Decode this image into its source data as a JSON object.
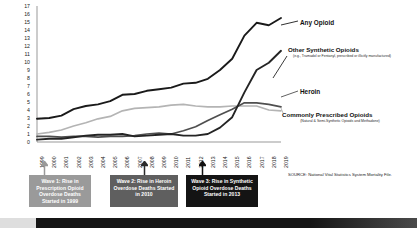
{
  "chart_data": {
    "type": "line",
    "title": "",
    "xlabel": "",
    "ylabel": "Deaths per 100,000 population",
    "ylim": [
      0,
      17
    ],
    "xlim": [
      1999,
      2019
    ],
    "grid": false,
    "legend_position": "inline-right",
    "x": [
      1999,
      2000,
      2001,
      2002,
      2003,
      2004,
      2005,
      2006,
      2007,
      2008,
      2009,
      2010,
      2011,
      2012,
      2013,
      2014,
      2015,
      2016,
      2017,
      2018,
      2019
    ],
    "y_ticks": [
      17,
      16,
      15,
      14,
      13,
      12,
      11,
      10,
      9,
      8,
      7,
      6,
      5,
      4,
      3,
      2,
      1,
      0
    ],
    "x_ticks": [
      "1999",
      "2000",
      "2001",
      "2002",
      "2003",
      "2004",
      "2005",
      "2006",
      "2007",
      "2008",
      "2009",
      "2010",
      "2011",
      "2012",
      "2013",
      "2014",
      "2015",
      "2016",
      "2017",
      "2018",
      "2019"
    ],
    "series": [
      {
        "name": "Any Opioid",
        "color": "#1a1a1a",
        "width": 1.9,
        "values": [
          2.9,
          3.0,
          3.3,
          4.1,
          4.5,
          4.7,
          5.1,
          5.9,
          6.0,
          6.4,
          6.6,
          6.8,
          7.3,
          7.4,
          7.9,
          9.0,
          10.4,
          13.3,
          14.9,
          14.6,
          15.5
        ]
      },
      {
        "name": "Commonly Prescribed Opioids",
        "color": "#b4b4b4",
        "width": 1.7,
        "values": [
          1.0,
          1.2,
          1.5,
          2.0,
          2.4,
          2.9,
          3.2,
          3.9,
          4.2,
          4.3,
          4.4,
          4.6,
          4.7,
          4.5,
          4.4,
          4.4,
          4.5,
          4.5,
          4.5,
          4.0,
          3.9
        ]
      },
      {
        "name": "Heroin",
        "color": "#4f4f4f",
        "width": 1.7,
        "values": [
          0.7,
          0.7,
          0.6,
          0.7,
          0.7,
          0.6,
          0.7,
          0.7,
          0.8,
          1.0,
          1.1,
          1.0,
          1.4,
          1.9,
          2.7,
          3.4,
          4.1,
          4.9,
          4.9,
          4.7,
          4.4
        ]
      },
      {
        "name": "Other Synthetic Opioids",
        "color": "#242424",
        "width": 1.9,
        "values": [
          0.3,
          0.4,
          0.4,
          0.6,
          0.8,
          0.9,
          0.9,
          1.0,
          0.7,
          0.8,
          0.9,
          1.0,
          0.8,
          0.8,
          1.0,
          1.8,
          3.1,
          6.2,
          9.0,
          9.9,
          11.4
        ]
      }
    ],
    "annotations": [
      {
        "id": "wave1",
        "label": "Wave 1: Rise in Prescription Opioid Overdose Deaths Started in 1999",
        "year": 1999,
        "color": "#9a9a9a"
      },
      {
        "id": "wave2",
        "label": "Wave 2: Rise in Heroin Overdose Deaths Started in 2010",
        "year": 2010,
        "color": "#5f5f5f"
      },
      {
        "id": "wave3",
        "label": "Wave 3: Rise in Synthetic Opioid Overdose Deaths Started in 2013",
        "year": 2013,
        "color": "#141414"
      }
    ]
  },
  "axis": {
    "y_title": "Deaths per 100,000 population"
  },
  "labels": {
    "any_opioid": "Any Opioid",
    "other_synthetic": "Other Synthetic Opioids",
    "other_synthetic_sub": "(e.g., Tramadol or Fentanyl, prescribed or illicitly manufactured)",
    "heroin": "Heroin",
    "commonly_prescribed": "Commonly Prescribed Opioids",
    "commonly_prescribed_sub": "(Natural & Semi-Synthetic Opioids and Methadone)"
  },
  "waves": {
    "wave1": "Wave 1: Rise in Prescription Opioid Overdose Deaths Started in 1999",
    "wave2": "Wave 2: Rise in Heroin Overdose Deaths Started in 2010",
    "wave3": "Wave 3: Rise in Synthetic Opioid Overdose Deaths Started in 2013"
  },
  "source": {
    "text": "SOURCE: National Vital Statistics System Mortality File."
  }
}
